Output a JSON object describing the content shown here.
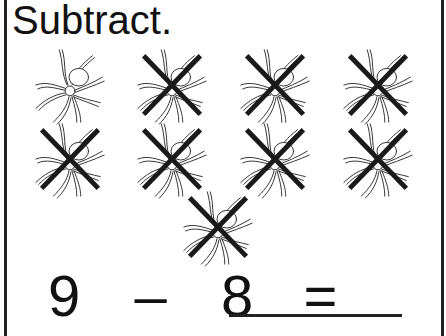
{
  "title": "Subtract.",
  "spiders": {
    "total": 9,
    "crossed_out": 8,
    "items": [
      {
        "x": 28,
        "y": 44,
        "crossed": false
      },
      {
        "x": 130,
        "y": 44,
        "crossed": true
      },
      {
        "x": 233,
        "y": 44,
        "crossed": true
      },
      {
        "x": 336,
        "y": 44,
        "crossed": true
      },
      {
        "x": 28,
        "y": 118,
        "crossed": true
      },
      {
        "x": 130,
        "y": 118,
        "crossed": true
      },
      {
        "x": 233,
        "y": 118,
        "crossed": true
      },
      {
        "x": 336,
        "y": 118,
        "crossed": true
      },
      {
        "x": 176,
        "y": 186,
        "crossed": true
      }
    ]
  },
  "equation": {
    "minuend": "9",
    "operator": "–",
    "subtrahend": "8",
    "equals": "=",
    "answer": ""
  },
  "colors": {
    "ink": "#111111",
    "cross": "#1a1a1a",
    "background": "#ffffff"
  }
}
